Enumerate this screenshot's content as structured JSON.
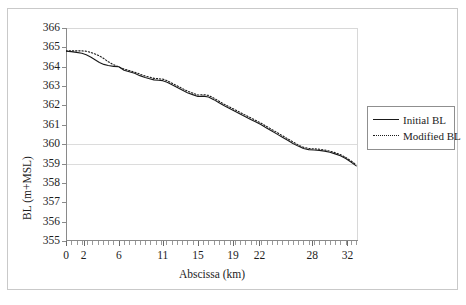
{
  "figure": {
    "background": "#ffffff",
    "border_color": "#c9c9c9"
  },
  "chart_data": {
    "type": "line",
    "title": "",
    "xlabel": "Abscissa (km)",
    "ylabel": "BL (m+MSL)",
    "xlim": [
      0,
      33.2
    ],
    "ylim": [
      355,
      366
    ],
    "ytick_step": 1,
    "grid": "horizontal-partial",
    "gridlines_at": [
      360,
      359
    ],
    "legend_position": "right",
    "yticks": [
      366,
      365,
      364,
      363,
      362,
      361,
      360,
      359,
      358,
      357,
      356,
      355
    ],
    "ytick_labels": [
      "366",
      "365",
      "364",
      "363",
      "362",
      "361",
      "360",
      "359",
      "358",
      "357",
      "356",
      "355"
    ],
    "xticks": [
      0,
      2,
      6,
      11,
      15,
      19,
      22,
      28,
      32
    ],
    "xtick_labels": [
      "0",
      "2",
      "6",
      "11",
      "15",
      "19",
      "22",
      "28",
      "32"
    ],
    "line_color": "#1a1a1a",
    "series": [
      {
        "name": "Initial BL",
        "style": "solid",
        "color": "#1a1a1a",
        "x": [
          0.0,
          0.6,
          1.2,
          1.8,
          2.3,
          2.8,
          3.3,
          3.8,
          4.3,
          4.8,
          5.4,
          6.0,
          6.6,
          7.2,
          7.8,
          8.4,
          9.0,
          9.5,
          10.0,
          10.5,
          11.0,
          11.5,
          12.0,
          12.6,
          13.2,
          13.8,
          14.4,
          15.0,
          15.6,
          16.2,
          16.8,
          17.4,
          18.0,
          18.6,
          19.2,
          19.8,
          20.4,
          21.0,
          21.6,
          22.2,
          22.8,
          23.4,
          24.0,
          24.6,
          25.2,
          25.8,
          26.4,
          27.0,
          27.6,
          28.2,
          28.8,
          29.4,
          30.0,
          30.6,
          31.2,
          31.8,
          32.4,
          33.0
        ],
        "y": [
          364.8,
          364.78,
          364.74,
          364.7,
          364.62,
          364.5,
          364.36,
          364.22,
          364.12,
          364.06,
          364.02,
          364.0,
          363.82,
          363.74,
          363.66,
          363.54,
          363.44,
          363.38,
          363.32,
          363.3,
          363.28,
          363.2,
          363.08,
          362.94,
          362.8,
          362.66,
          362.56,
          362.46,
          362.48,
          362.44,
          362.3,
          362.14,
          361.98,
          361.84,
          361.7,
          361.56,
          361.42,
          361.28,
          361.14,
          361.0,
          360.84,
          360.68,
          360.52,
          360.36,
          360.2,
          360.04,
          359.9,
          359.78,
          359.72,
          359.7,
          359.68,
          359.64,
          359.58,
          359.5,
          359.4,
          359.26,
          359.08,
          358.88
        ]
      },
      {
        "name": "Modified BL",
        "style": "dotted",
        "color": "#1a1a1a",
        "x": [
          0.0,
          0.6,
          1.2,
          1.8,
          2.3,
          2.8,
          3.3,
          3.8,
          4.3,
          4.8,
          5.4,
          6.0,
          6.6,
          7.2,
          7.8,
          8.4,
          9.0,
          9.5,
          10.0,
          10.5,
          11.0,
          11.5,
          12.0,
          12.6,
          13.2,
          13.8,
          14.4,
          15.0,
          15.6,
          16.2,
          16.8,
          17.4,
          18.0,
          18.6,
          19.2,
          19.8,
          20.4,
          21.0,
          21.6,
          22.2,
          22.8,
          23.4,
          24.0,
          24.6,
          25.2,
          25.8,
          26.4,
          27.0,
          27.6,
          28.2,
          28.8,
          29.4,
          30.0,
          30.6,
          31.2,
          31.8,
          32.4,
          33.0
        ],
        "y": [
          364.82,
          364.82,
          364.82,
          364.82,
          364.8,
          364.74,
          364.66,
          364.56,
          364.42,
          364.26,
          364.1,
          364.0,
          363.88,
          363.8,
          363.72,
          363.62,
          363.52,
          363.46,
          363.4,
          363.38,
          363.36,
          363.28,
          363.16,
          363.02,
          362.88,
          362.74,
          362.64,
          362.54,
          362.56,
          362.52,
          362.38,
          362.22,
          362.06,
          361.92,
          361.78,
          361.64,
          361.5,
          361.36,
          361.22,
          361.08,
          360.92,
          360.76,
          360.6,
          360.44,
          360.28,
          360.12,
          359.96,
          359.84,
          359.78,
          359.76,
          359.74,
          359.7,
          359.64,
          359.56,
          359.46,
          359.32,
          359.14,
          358.94
        ]
      }
    ]
  },
  "legend": {
    "entries": [
      {
        "label": "Initial BL",
        "style": "solid"
      },
      {
        "label": "Modified BL",
        "style": "dotted"
      }
    ]
  }
}
